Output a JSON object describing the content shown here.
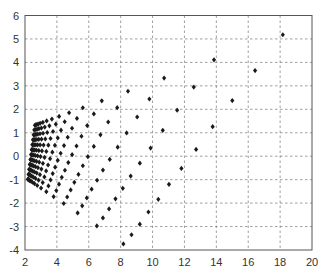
{
  "chart_data": {
    "type": "scatter",
    "title": "",
    "xlabel": "",
    "ylabel": "",
    "xlim": [
      2,
      20
    ],
    "ylim": [
      -4,
      6
    ],
    "xticks": [
      2,
      4,
      6,
      8,
      10,
      12,
      14,
      16,
      18,
      20
    ],
    "yticks": [
      -4,
      -3,
      -2,
      -1,
      0,
      1,
      2,
      3,
      4,
      5,
      6
    ],
    "xtick_labels": [
      "2",
      "4",
      "6",
      "8",
      "10",
      "12",
      "14",
      "16",
      "18",
      "20"
    ],
    "ytick_labels": [
      "-4",
      "-3",
      "-2",
      "-1",
      "0",
      "1",
      "2",
      "3",
      "4",
      "5",
      "6"
    ],
    "grid": true,
    "grid_style": "dashed",
    "legend": null,
    "marker": "diamond",
    "marker_color": "#1a1a1a",
    "structure": {
      "description": "fan-shaped grid of points: 12 rows, 16 columns per row, spacing grows toward the right",
      "rows": 12,
      "cols": 16,
      "growth_ratio": 1.38,
      "row_left_ends": [
        [
          2.62,
          1.32
        ],
        [
          2.58,
          1.12
        ],
        [
          2.54,
          0.91
        ],
        [
          2.5,
          0.7
        ],
        [
          2.46,
          0.49
        ],
        [
          2.42,
          0.28
        ],
        [
          2.38,
          0.07
        ],
        [
          2.34,
          -0.14
        ],
        [
          2.3,
          -0.35
        ],
        [
          2.26,
          -0.56
        ],
        [
          2.22,
          -0.77
        ],
        [
          2.18,
          -0.98
        ]
      ],
      "row_right_ends": [
        [
          18.17,
          5.18
        ],
        [
          16.43,
          3.65
        ],
        [
          15.0,
          2.37
        ],
        [
          13.77,
          1.26
        ],
        [
          12.73,
          0.29
        ],
        [
          11.81,
          -0.52
        ],
        [
          11.03,
          -1.2
        ],
        [
          10.36,
          -1.84
        ],
        [
          9.74,
          -2.38
        ],
        [
          9.2,
          -2.9
        ],
        [
          8.68,
          -3.35
        ],
        [
          8.17,
          -3.74
        ]
      ]
    },
    "measured_points": [
      {
        "x": 18.17,
        "y": 5.18
      },
      {
        "x": 14.07,
        "y": 4.17
      },
      {
        "x": 11.43,
        "y": 3.54
      },
      {
        "x": 9.59,
        "y": 3.04
      },
      {
        "x": 8.21,
        "y": 2.68
      },
      {
        "x": 7.19,
        "y": 2.43
      },
      {
        "x": 6.37,
        "y": 2.26
      },
      {
        "x": 16.43,
        "y": 3.65
      },
      {
        "x": 12.98,
        "y": 3.0
      },
      {
        "x": 9.72,
        "y": 2.57
      },
      {
        "x": 9.05,
        "y": 2.3
      },
      {
        "x": 7.88,
        "y": 2.01
      },
      {
        "x": 6.91,
        "y": 1.86
      },
      {
        "x": 15.0,
        "y": 2.37
      },
      {
        "x": 12.02,
        "y": 2.0
      },
      {
        "x": 10.05,
        "y": 1.76
      },
      {
        "x": 13.77,
        "y": 1.26
      },
      {
        "x": 11.24,
        "y": 1.1
      },
      {
        "x": 9.47,
        "y": 1.02
      },
      {
        "x": 12.73,
        "y": 0.29
      },
      {
        "x": 10.53,
        "y": 0.34
      },
      {
        "x": 11.81,
        "y": -0.52
      },
      {
        "x": 9.88,
        "y": -0.35
      },
      {
        "x": 11.03,
        "y": -1.2
      },
      {
        "x": 9.32,
        "y": -0.98
      },
      {
        "x": 10.36,
        "y": -1.84
      },
      {
        "x": 9.74,
        "y": -2.38
      },
      {
        "x": 7.19,
        "y": -3.29
      },
      {
        "x": 6.31,
        "y": -2.9
      },
      {
        "x": 8.17,
        "y": -3.74
      }
    ]
  },
  "layout": {
    "plot_left_px": 25,
    "plot_right_px": 312,
    "plot_top_px": 15.5,
    "plot_bottom_px": 250,
    "frame_color": "#555555",
    "grid_color": "#777777"
  }
}
